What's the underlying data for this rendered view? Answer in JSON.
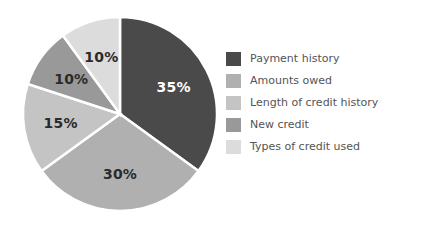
{
  "chart_data": {
    "type": "pie",
    "title": "",
    "subtitle": "",
    "xlabel": "",
    "ylabel": "",
    "legend_position": "right",
    "grid": false,
    "start_angle_deg": 0,
    "direction": "clockwise",
    "categories": [
      "Payment history",
      "Amounts owed",
      "Length of credit history",
      "New credit",
      "Types of credit used"
    ],
    "values": [
      35,
      30,
      15,
      10,
      10
    ],
    "value_unit": "%",
    "data_labels": [
      "35%",
      "30%",
      "15%",
      "10%",
      "10%"
    ],
    "slice_colors": [
      "#4a4a4a",
      "#b0b0b0",
      "#c4c4c4",
      "#999999",
      "#dcdcdc"
    ],
    "label_text_colors": [
      "#ffffff",
      "#2b2b2b",
      "#2b2b2b",
      "#2b2b2b",
      "#2b2b2b"
    ],
    "background_color": "#ffffff",
    "slice_border_color": "#ffffff",
    "legend_text_color": "#545454",
    "slices": [
      {
        "label": "Payment history",
        "value": 35,
        "data_label": "35%",
        "color": "#4a4a4a"
      },
      {
        "label": "Amounts owed",
        "value": 30,
        "data_label": "30%",
        "color": "#b0b0b0"
      },
      {
        "label": "Length of credit history",
        "value": 15,
        "data_label": "15%",
        "color": "#c4c4c4"
      },
      {
        "label": "New credit",
        "value": 10,
        "data_label": "10%",
        "color": "#999999"
      },
      {
        "label": "Types of credit used",
        "value": 10,
        "data_label": "10%",
        "color": "#dcdcdc"
      }
    ]
  },
  "legend": {
    "items": [
      {
        "label": "Payment history",
        "color": "#4a4a4a"
      },
      {
        "label": "Amounts owed",
        "color": "#b0b0b0"
      },
      {
        "label": "Length of credit history",
        "color": "#c4c4c4"
      },
      {
        "label": "New credit",
        "color": "#999999"
      },
      {
        "label": "Types of credit used",
        "color": "#dcdcdc"
      }
    ]
  }
}
